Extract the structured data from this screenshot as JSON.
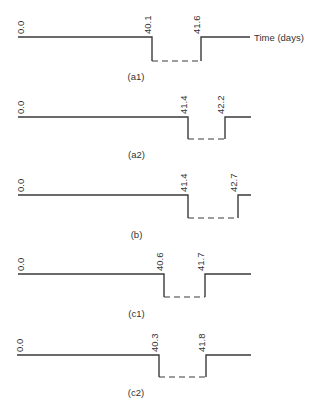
{
  "axis_label": "Time (days)",
  "panels": [
    {
      "id": "a1",
      "caption": "(a1)",
      "start_label": "0.0",
      "drop_label": "40.1",
      "rise_label": "41.6",
      "y": 37,
      "y_low": 61,
      "x_start": 18,
      "x_drop": 152,
      "x_rise": 201,
      "x_end": 250,
      "caption_y": 80
    },
    {
      "id": "a2",
      "caption": "(a2)",
      "start_label": "0.0",
      "drop_label": "41.4",
      "rise_label": "42.2",
      "y": 117,
      "y_low": 139,
      "x_start": 18,
      "x_drop": 188,
      "x_rise": 225,
      "x_end": 251,
      "caption_y": 158
    },
    {
      "id": "b",
      "caption": "(b)",
      "start_label": "0.0",
      "drop_label": "41.4",
      "rise_label": "42.7",
      "y": 195,
      "y_low": 218,
      "x_start": 18,
      "x_drop": 188,
      "x_rise": 238,
      "x_end": 251,
      "caption_y": 238
    },
    {
      "id": "c1",
      "caption": "(c1)",
      "start_label": "0.0",
      "drop_label": "40.6",
      "rise_label": "41.7",
      "y": 274,
      "y_low": 297,
      "x_start": 18,
      "x_drop": 164,
      "x_rise": 205,
      "x_end": 251,
      "caption_y": 317
    },
    {
      "id": "c2",
      "caption": "(c2)",
      "start_label": "0.0",
      "drop_label": "40.3",
      "rise_label": "41.8",
      "y": 355,
      "y_low": 377,
      "x_start": 17,
      "x_drop": 159,
      "x_rise": 206,
      "x_end": 251,
      "caption_y": 396
    }
  ]
}
